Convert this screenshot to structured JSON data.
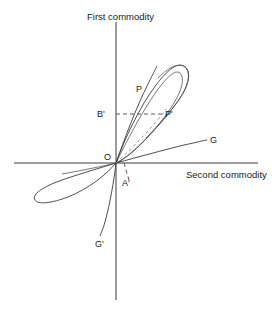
{
  "figure": {
    "kind": "economic-offer-curve-diagram",
    "axes": {
      "vertical_label": "First commodity",
      "horizontal_label": "Second commodity",
      "origin_label": "O"
    },
    "point_labels": {
      "p": "P",
      "p_prime": "P'",
      "b_prime": "B'",
      "a_prime": "A'",
      "g": "G",
      "g_prime": "G'"
    },
    "colors": {
      "axis": "#3c3c3c",
      "curve": "#3c3c3c",
      "curve_light": "#555555",
      "dashed": "#4a4a4a",
      "dashed_curve": "#8a8a8a",
      "background": "#ffffff",
      "text": "#1a1a1a"
    },
    "geometry": {
      "origin_x": 116,
      "origin_y": 163,
      "vertical_axis_top": 22,
      "vertical_axis_bottom": 300,
      "horizontal_axis_left": 14,
      "horizontal_axis_right": 258,
      "upper_loop_apex_x": 176,
      "upper_loop_apex_y": 67,
      "lower_loop_tip_x": 34,
      "lower_loop_tip_y": 200,
      "p_prime_x": 163,
      "p_prime_y": 114,
      "g_end_x": 206,
      "g_end_y": 140,
      "g_prime_end_x": 100,
      "g_prime_end_y": 235
    }
  }
}
